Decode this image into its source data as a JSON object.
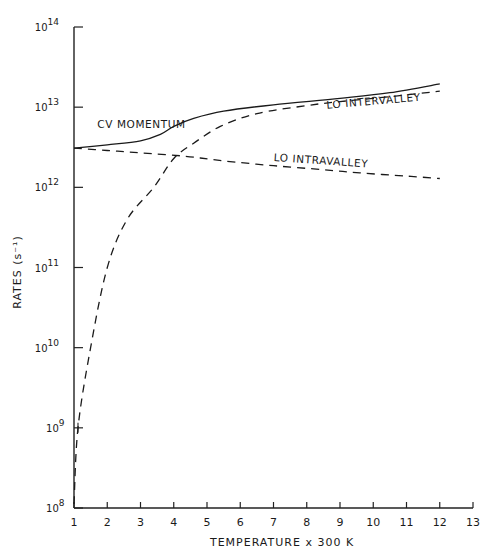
{
  "chart_data": {
    "type": "line",
    "title": "",
    "xlabel": "TEMPERATURE x 300 K",
    "ylabel": "RATES (s⁻¹)",
    "xlim": [
      1,
      13
    ],
    "ylim_log10": [
      8,
      14
    ],
    "yscale": "log",
    "grid": false,
    "legend": "inline labels on curves",
    "x_ticks": [
      1,
      2,
      3,
      4,
      5,
      6,
      7,
      8,
      9,
      10,
      11,
      12,
      13
    ],
    "x_tick_labels": [
      "1",
      "2",
      "3",
      "4",
      "5",
      "6",
      "7",
      "8",
      "9",
      "10",
      "11",
      "12",
      "13"
    ],
    "y_ticks_exp": [
      8,
      9,
      10,
      11,
      12,
      13,
      14
    ],
    "y_tick_labels": [
      "10^8",
      "10^9",
      "10^10",
      "10^11",
      "10^12",
      "10^13",
      "10^14"
    ],
    "series": [
      {
        "name": "CV MOMENTUM",
        "style": "solid",
        "x": [
          1.0,
          2.0,
          3.0,
          3.6,
          4.0,
          4.6,
          5.5,
          7.0,
          9.0,
          10.5,
          12.0
        ],
        "log10_y": [
          12.49,
          12.53,
          12.58,
          12.66,
          12.76,
          12.86,
          12.95,
          13.03,
          13.11,
          13.18,
          13.29
        ]
      },
      {
        "name": "LO INTERVALLEY",
        "style": "dashed",
        "x": [
          1.0,
          1.12,
          1.5,
          2.0,
          2.6,
          3.4,
          4.0,
          4.6,
          5.4,
          6.5,
          8.0,
          9.0,
          10.5,
          12.0
        ],
        "log10_y": [
          8.05,
          9.0,
          10.0,
          11.0,
          11.6,
          12.0,
          12.36,
          12.55,
          12.76,
          12.92,
          13.02,
          13.07,
          13.13,
          13.2
        ]
      },
      {
        "name": "LO INTRAVALLEY",
        "style": "dashed",
        "x": [
          1.0,
          2.0,
          3.0,
          4.3,
          5.5,
          7.0,
          8.5,
          9.6,
          11.0,
          12.0
        ],
        "log10_y": [
          12.49,
          12.46,
          12.43,
          12.39,
          12.33,
          12.27,
          12.22,
          12.18,
          12.14,
          12.11
        ]
      }
    ],
    "annotations": [
      {
        "text": "CV MOMENTUM",
        "x": 1.7,
        "log10_y": 12.74
      },
      {
        "text": "LO INTERVALLEY",
        "x": 8.6,
        "log10_y": 12.98
      },
      {
        "text": "LO INTRAVALLEY",
        "x": 7.0,
        "log10_y": 12.33
      }
    ]
  }
}
